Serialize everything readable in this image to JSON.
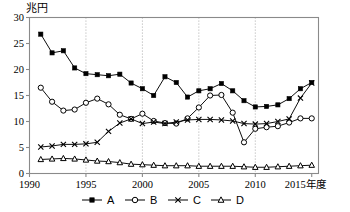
{
  "chart_data": {
    "type": "line",
    "title": "",
    "subtitle": "",
    "unit_label": "兆円",
    "xlabel": "",
    "ylabel": "",
    "x_axis_suffix": "年度",
    "x": [
      1991,
      1992,
      1993,
      1994,
      1995,
      1996,
      1997,
      1998,
      1999,
      2000,
      2001,
      2002,
      2003,
      2004,
      2005,
      2006,
      2007,
      2008,
      2009,
      2010,
      2011,
      2012,
      2013,
      2014,
      2015
    ],
    "xlim": [
      1990,
      2015.6
    ],
    "ylim": [
      0,
      30
    ],
    "ytick_values": [
      0,
      5,
      10,
      15,
      20,
      25,
      30
    ],
    "ytick_labels": [
      "0",
      "5",
      "10",
      "15",
      "20",
      "25",
      "30"
    ],
    "xtick_values": [
      1990,
      1995,
      2000,
      2005,
      2010,
      2015
    ],
    "xtick_labels": [
      "1990",
      "1995",
      "2000",
      "2005",
      "2010",
      "2015年度"
    ],
    "gridlines_x": [
      1995,
      2000,
      2005,
      2010
    ],
    "grid": "vertical-dotted",
    "legend_position": "below",
    "series": [
      {
        "name": "A",
        "marker": "filled-square",
        "values": [
          26.8,
          23.2,
          23.6,
          20.3,
          19.2,
          19.0,
          18.8,
          19.1,
          17.4,
          16.3,
          15.0,
          18.6,
          17.5,
          14.7,
          15.9,
          16.3,
          17.3,
          15.9,
          14.0,
          12.8,
          12.9,
          13.2,
          14.4,
          16.3,
          17.5
        ]
      },
      {
        "name": "B",
        "marker": "open-circle",
        "values": [
          16.5,
          13.8,
          12.1,
          12.3,
          13.6,
          14.4,
          13.3,
          11.3,
          10.5,
          11.5,
          10.1,
          9.7,
          9.6,
          10.6,
          12.7,
          15.0,
          15.1,
          11.7,
          6.0,
          8.6,
          8.9,
          9.1,
          9.8,
          10.6,
          10.6
        ]
      },
      {
        "name": "C",
        "marker": "cross",
        "values": [
          5.1,
          5.3,
          5.6,
          5.6,
          5.7,
          6.0,
          8.1,
          9.7,
          10.5,
          9.6,
          9.9,
          9.6,
          9.9,
          10.3,
          10.4,
          10.4,
          10.3,
          10.1,
          9.6,
          9.5,
          9.6,
          10.0,
          10.5,
          14.5,
          17.4
        ]
      },
      {
        "name": "D",
        "marker": "open-triangle",
        "values": [
          2.7,
          2.8,
          2.9,
          2.8,
          2.6,
          2.4,
          2.3,
          2.1,
          1.8,
          1.7,
          1.6,
          1.5,
          1.5,
          1.5,
          1.4,
          1.4,
          1.4,
          1.4,
          1.3,
          1.2,
          1.2,
          1.3,
          1.4,
          1.5,
          1.6
        ]
      }
    ]
  },
  "legend": {
    "items": [
      {
        "label": "A",
        "marker": "filled-square"
      },
      {
        "label": "B",
        "marker": "open-circle"
      },
      {
        "label": "C",
        "marker": "cross"
      },
      {
        "label": "D",
        "marker": "open-triangle"
      }
    ]
  },
  "colors": {
    "line": "#000000",
    "axis": "#8a8a8a",
    "grid": "#b0b0b0",
    "background": "#ffffff"
  }
}
